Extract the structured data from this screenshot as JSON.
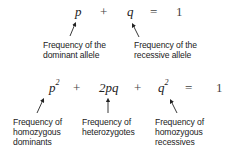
{
  "equation1": {
    "terms": [
      "p",
      "+",
      "q",
      "=",
      "1"
    ],
    "labels": {
      "p": [
        "Frequency of the",
        "dominant allele"
      ],
      "q": [
        "Frequency of the",
        "recessive allele"
      ]
    }
  },
  "equation2": {
    "terms": [
      "p",
      "2",
      "+",
      "2pq",
      "+",
      "q",
      "2",
      "=",
      "1"
    ],
    "labels": {
      "p2": [
        "Frequency of",
        "homozygous",
        "dominants"
      ],
      "2pq": [
        "Frequency of",
        "heterozygotes"
      ],
      "q2": [
        "Frequency of",
        "homozygous",
        "recessives"
      ]
    }
  }
}
